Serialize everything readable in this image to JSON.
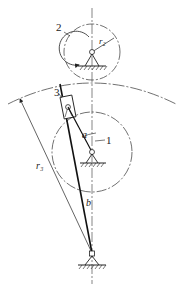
{
  "diagram": {
    "type": "mechanism",
    "labels": {
      "gear2": "2",
      "slider3": "3",
      "link1": "1",
      "radius2": "r₂",
      "radius3": "r₃",
      "link_a": "a",
      "link_b": "b"
    },
    "colors": {
      "line": "#222222",
      "background": "#ffffff"
    }
  }
}
